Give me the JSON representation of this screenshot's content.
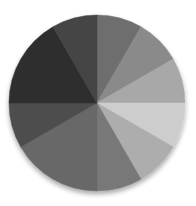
{
  "chart_data": {
    "type": "pie",
    "title": "",
    "legend": [],
    "start_angle_deg": 0,
    "direction": "clockwise",
    "center": [
      97,
      103
    ],
    "radius": 88,
    "slices": [
      {
        "start": 0,
        "end": 30,
        "value": 30,
        "color": "#6e6e6e"
      },
      {
        "start": 30,
        "end": 60,
        "value": 30,
        "color": "#8a8a8a"
      },
      {
        "start": 60,
        "end": 90,
        "value": 30,
        "color": "#a8a8a8"
      },
      {
        "start": 90,
        "end": 120,
        "value": 30,
        "color": "#cdcdcd"
      },
      {
        "start": 120,
        "end": 150,
        "value": 30,
        "color": "#adadad"
      },
      {
        "start": 150,
        "end": 180,
        "value": 30,
        "color": "#787878"
      },
      {
        "start": 180,
        "end": 240,
        "value": 60,
        "color": "#686868"
      },
      {
        "start": 240,
        "end": 270,
        "value": 30,
        "color": "#4e4e4e"
      },
      {
        "start": 270,
        "end": 330,
        "value": 60,
        "color": "#2e2e2e"
      },
      {
        "start": 330,
        "end": 360,
        "value": 30,
        "color": "#444444"
      }
    ],
    "values": [
      30,
      30,
      30,
      30,
      30,
      30,
      60,
      30,
      60,
      30
    ],
    "categories": [
      "",
      "",
      "",
      "",
      "",
      "",
      "",
      "",
      "",
      ""
    ]
  }
}
